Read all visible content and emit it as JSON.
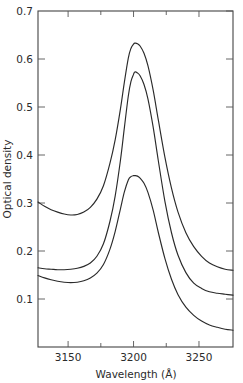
{
  "figure": {
    "width": 243,
    "height": 383,
    "background": "#ffffff",
    "line_color": "#2a2a2a",
    "axis_color": "#444444"
  },
  "chart_data": {
    "type": "line",
    "title": "",
    "xlabel": "Wavelength (Å)",
    "ylabel": "Optical density",
    "xlim": [
      3127,
      3276
    ],
    "ylim": [
      0.0,
      0.7
    ],
    "xticks": [
      3150,
      3200,
      3250
    ],
    "xtick_labels": [
      "3150",
      "3200",
      "3250"
    ],
    "xminor_ticks": [
      3175,
      3225
    ],
    "yticks": [
      0.1,
      0.2,
      0.3,
      0.4,
      0.5,
      0.6,
      0.7
    ],
    "ytick_labels": [
      "0.1",
      "0.2",
      "0.3",
      "0.4",
      "0.5",
      "0.6",
      "0.7"
    ],
    "grid": false,
    "legend": null,
    "ticks_on_all_sides": true,
    "x": [
      3127,
      3132,
      3137,
      3142,
      3147,
      3152,
      3157,
      3162,
      3167,
      3172,
      3177,
      3182,
      3186,
      3190,
      3193,
      3196,
      3198,
      3200,
      3201,
      3203,
      3205,
      3208,
      3211,
      3215,
      3219,
      3224,
      3229,
      3234,
      3240,
      3246,
      3252,
      3258,
      3264,
      3270,
      3276
    ],
    "series": [
      {
        "name": "curve-top",
        "peak_wavelength": 3201,
        "peak_value": 0.633,
        "baseline_left": 0.302,
        "baseline_right": 0.16,
        "values": [
          0.302,
          0.293,
          0.286,
          0.281,
          0.277,
          0.275,
          0.276,
          0.281,
          0.291,
          0.308,
          0.336,
          0.383,
          0.432,
          0.496,
          0.552,
          0.602,
          0.622,
          0.631,
          0.633,
          0.632,
          0.627,
          0.612,
          0.586,
          0.535,
          0.472,
          0.395,
          0.331,
          0.281,
          0.238,
          0.209,
          0.189,
          0.175,
          0.167,
          0.162,
          0.16
        ]
      },
      {
        "name": "curve-middle",
        "peak_wavelength": 3201,
        "peak_value": 0.573,
        "baseline_left": 0.165,
        "baseline_right": 0.108,
        "values": [
          0.165,
          0.163,
          0.162,
          0.161,
          0.161,
          0.162,
          0.164,
          0.168,
          0.175,
          0.189,
          0.215,
          0.262,
          0.315,
          0.389,
          0.457,
          0.523,
          0.553,
          0.568,
          0.573,
          0.571,
          0.565,
          0.547,
          0.517,
          0.458,
          0.387,
          0.303,
          0.238,
          0.191,
          0.155,
          0.133,
          0.122,
          0.115,
          0.112,
          0.11,
          0.108
        ]
      },
      {
        "name": "curve-bottom",
        "peak_wavelength": 3201,
        "peak_value": 0.357,
        "baseline_left": 0.149,
        "baseline_right": 0.035,
        "values": [
          0.149,
          0.144,
          0.14,
          0.137,
          0.135,
          0.134,
          0.135,
          0.138,
          0.144,
          0.154,
          0.172,
          0.204,
          0.241,
          0.288,
          0.323,
          0.348,
          0.355,
          0.357,
          0.357,
          0.356,
          0.352,
          0.341,
          0.322,
          0.285,
          0.238,
          0.184,
          0.141,
          0.109,
          0.083,
          0.066,
          0.054,
          0.046,
          0.041,
          0.037,
          0.035
        ]
      }
    ]
  }
}
